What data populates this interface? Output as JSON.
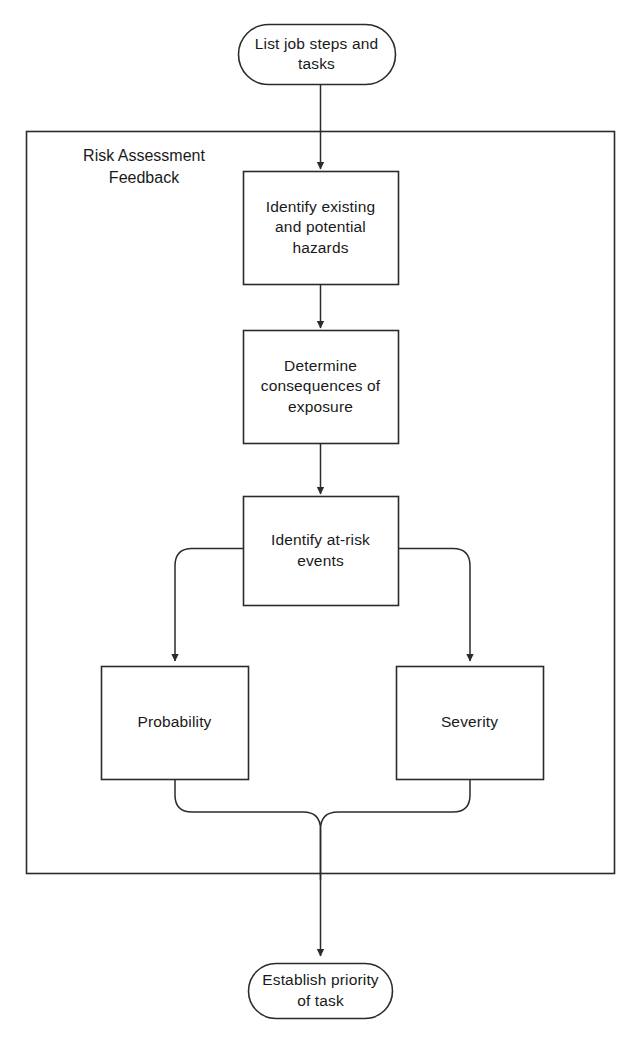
{
  "diagram": {
    "stroke_color": "#2b2b2b",
    "fill_color": "#ffffff",
    "text_color": "#1a1a1a",
    "group": {
      "label": "Risk Assessment\nFeedback",
      "label_line1": "Risk Assessment",
      "label_line2": "Feedback"
    },
    "nodes": {
      "start": {
        "shape": "terminator",
        "label": "List job steps and\ntasks"
      },
      "identify_hazards": {
        "shape": "process",
        "label": "Identify existing\nand potential\nhazards"
      },
      "determine_consequences": {
        "shape": "process",
        "label": "Determine\nconsequences of\nexposure"
      },
      "identify_events": {
        "shape": "process",
        "label": "Identify at-risk\nevents"
      },
      "probability": {
        "shape": "process",
        "label": "Probability"
      },
      "severity": {
        "shape": "process",
        "label": "Severity"
      },
      "end": {
        "shape": "terminator",
        "label": "Establish priority\nof task"
      }
    },
    "connectors": [
      {
        "from": "start",
        "to": "identify_hazards",
        "arrow": true
      },
      {
        "from": "identify_hazards",
        "to": "determine_consequences",
        "arrow": true
      },
      {
        "from": "determine_consequences",
        "to": "identify_events",
        "arrow": true
      },
      {
        "from": "identify_events",
        "to": "probability",
        "arrow": true
      },
      {
        "from": "identify_events",
        "to": "severity",
        "arrow": true
      },
      {
        "from": "probability",
        "to": "end",
        "arrow": true
      },
      {
        "from": "severity",
        "to": "end",
        "arrow": true
      }
    ]
  }
}
